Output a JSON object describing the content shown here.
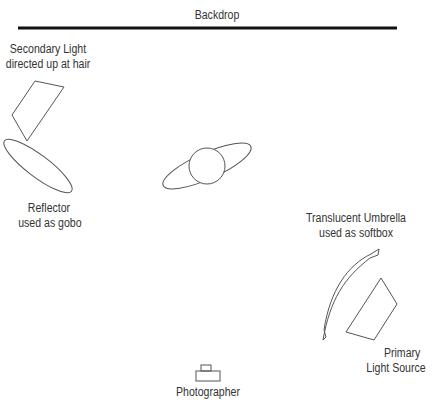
{
  "title": "Backdrop",
  "labels": {
    "backdrop": "Backdrop",
    "secondary_line1": "Secondary Light",
    "secondary_line2": "directed up at hair",
    "reflector_line1": "Reflector",
    "reflector_line2": "used as gobo",
    "umbrella_line1": "Translucent Umbrella",
    "umbrella_line2": "used as softbox",
    "primary_line1": "Primary",
    "primary_line2": "Light Source",
    "photographer": "Photographer"
  },
  "colors": {
    "stroke": "#555555",
    "backdrop": "#111111",
    "text": "#333333"
  }
}
